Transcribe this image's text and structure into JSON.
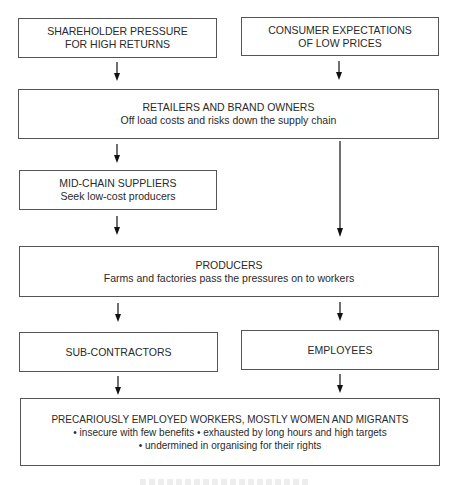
{
  "diagram": {
    "type": "flowchart",
    "nodes": {
      "shareholder": {
        "line1": "SHAREHOLDER PRESSURE",
        "line2": "FOR HIGH RETURNS"
      },
      "consumer": {
        "line1": "CONSUMER EXPECTATIONS",
        "line2": "OF LOW PRICES"
      },
      "retailers": {
        "title": "RETAILERS AND BRAND OWNERS",
        "subtitle": "Off load costs and risks down the supply chain"
      },
      "midchain": {
        "title": "MID-CHAIN SUPPLIERS",
        "subtitle": "Seek low-cost producers"
      },
      "producers": {
        "title": "PRODUCERS",
        "subtitle": "Farms and factories pass the pressures on to workers"
      },
      "subcontractors": {
        "title": "SUB-CONTRACTORS"
      },
      "employees": {
        "title": "EMPLOYEES"
      },
      "workers": {
        "title": "PRECARIOUSLY EMPLOYED WORKERS, MOSTLY WOMEN AND MIGRANTS",
        "bullet_line1": "• insecure with few benefits • exhausted by long hours and high targets",
        "bullet_line2": "• undermined in organising for their rights"
      }
    },
    "edges": [
      {
        "from": "shareholder",
        "to": "retailers"
      },
      {
        "from": "consumer",
        "to": "retailers"
      },
      {
        "from": "retailers",
        "to": "midchain"
      },
      {
        "from": "retailers",
        "to": "producers"
      },
      {
        "from": "midchain",
        "to": "producers"
      },
      {
        "from": "producers",
        "to": "subcontractors"
      },
      {
        "from": "producers",
        "to": "employees"
      },
      {
        "from": "subcontractors",
        "to": "workers"
      },
      {
        "from": "employees",
        "to": "workers"
      }
    ],
    "colors": {
      "border": "#555555",
      "text": "#2a2a2a",
      "arrow": "#111111",
      "background": "#ffffff"
    }
  }
}
